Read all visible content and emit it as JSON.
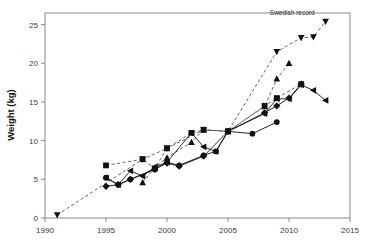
{
  "chart_data": {
    "type": "line",
    "title": "",
    "xlabel": "",
    "ylabel": "Weight (kg)",
    "xlim": [
      1990,
      2015
    ],
    "ylim": [
      0,
      26.5
    ],
    "xticks": [
      1990,
      1995,
      2000,
      2005,
      2010,
      2015
    ],
    "yticks": [
      0,
      5,
      10,
      15,
      20,
      25
    ],
    "grid": false,
    "legend": "none",
    "annotations": [
      {
        "text": "Swedish record",
        "x": 2012.1,
        "y": 26.2,
        "anchor": "end"
      }
    ],
    "series": [
      {
        "name": "Swedish record",
        "marker": "triangle-down",
        "linestyle": "dashed",
        "points": [
          {
            "x": 1991,
            "y": 0.4
          },
          {
            "x": 1998,
            "y": 7.6
          },
          {
            "x": 2000,
            "y": 9.0
          },
          {
            "x": 2003,
            "y": 11.4
          },
          {
            "x": 2005,
            "y": 11.2
          },
          {
            "x": 2009,
            "y": 21.5
          },
          {
            "x": 2011,
            "y": 23.3
          },
          {
            "x": 2012,
            "y": 23.4
          },
          {
            "x": 2013,
            "y": 25.4
          }
        ]
      },
      {
        "name": "squares-series",
        "marker": "square",
        "linestyle": "dashed",
        "points": [
          {
            "x": 1995,
            "y": 6.8
          },
          {
            "x": 1998,
            "y": 7.6
          },
          {
            "x": 1999,
            "y": 6.4
          },
          {
            "x": 2000,
            "y": 9.0
          },
          {
            "x": 2002,
            "y": 11.0
          },
          {
            "x": 2003,
            "y": 11.4
          },
          {
            "x": 2005,
            "y": 11.2
          },
          {
            "x": 2008,
            "y": 14.5
          },
          {
            "x": 2009,
            "y": 15.5
          },
          {
            "x": 2011,
            "y": 17.3
          }
        ]
      },
      {
        "name": "triangle-up-series",
        "marker": "triangle-up",
        "linestyle": "dashed",
        "points": [
          {
            "x": 1998,
            "y": 4.6
          },
          {
            "x": 1999,
            "y": 6.5
          },
          {
            "x": 2000,
            "y": 7.8
          },
          {
            "x": 2002,
            "y": 9.8
          },
          {
            "x": 2003,
            "y": 11.4
          },
          {
            "x": 2005,
            "y": 11.2
          },
          {
            "x": 2008,
            "y": 14.4
          },
          {
            "x": 2009,
            "y": 18.0
          },
          {
            "x": 2010,
            "y": 20.0
          }
        ]
      },
      {
        "name": "triangle-left-series",
        "marker": "triangle-left",
        "linestyle": "solid",
        "points": [
          {
            "x": 1995,
            "y": 5.2
          },
          {
            "x": 1996,
            "y": 4.3
          },
          {
            "x": 1997,
            "y": 6.1
          },
          {
            "x": 1998,
            "y": 5.4
          },
          {
            "x": 1999,
            "y": 6.6
          },
          {
            "x": 2000,
            "y": 7.2
          },
          {
            "x": 2002,
            "y": 11.0
          },
          {
            "x": 2003,
            "y": 9.2
          },
          {
            "x": 2004,
            "y": 8.6
          },
          {
            "x": 2005,
            "y": 11.2
          },
          {
            "x": 2008,
            "y": 13.5
          },
          {
            "x": 2009,
            "y": 15.4
          },
          {
            "x": 2010,
            "y": 15.4
          },
          {
            "x": 2011,
            "y": 17.2
          },
          {
            "x": 2012,
            "y": 16.5
          },
          {
            "x": 2013,
            "y": 15.2
          }
        ]
      },
      {
        "name": "circles-series",
        "marker": "circle",
        "linestyle": "solid",
        "points": [
          {
            "x": 1995,
            "y": 5.2
          },
          {
            "x": 1996,
            "y": 4.3
          },
          {
            "x": 1997,
            "y": 5.0
          },
          {
            "x": 1999,
            "y": 6.3
          },
          {
            "x": 2000,
            "y": 7.2
          },
          {
            "x": 2001,
            "y": 6.8
          },
          {
            "x": 2003,
            "y": 8.1
          },
          {
            "x": 2004,
            "y": 8.6
          },
          {
            "x": 2005,
            "y": 11.2
          },
          {
            "x": 2007,
            "y": 10.9
          },
          {
            "x": 2009,
            "y": 12.4
          }
        ]
      },
      {
        "name": "diamonds-series",
        "marker": "diamond",
        "linestyle": "solid",
        "points": [
          {
            "x": 1995,
            "y": 4.1
          },
          {
            "x": 1996,
            "y": 4.3
          },
          {
            "x": 1997,
            "y": 5.0
          },
          {
            "x": 1999,
            "y": 6.3
          },
          {
            "x": 2000,
            "y": 7.1
          },
          {
            "x": 2001,
            "y": 6.7
          },
          {
            "x": 2003,
            "y": 8.0
          },
          {
            "x": 2005,
            "y": 11.2
          },
          {
            "x": 2008,
            "y": 13.6
          },
          {
            "x": 2009,
            "y": 14.5
          },
          {
            "x": 2010,
            "y": 15.5
          },
          {
            "x": 2011,
            "y": 17.3
          }
        ]
      }
    ]
  },
  "colors": {
    "background": "#ffffff",
    "frame": "#8a8a8a",
    "marker": "#111111",
    "solid_line": "#111111",
    "dashed_line": "#555555",
    "text": "#1a1a1a"
  }
}
